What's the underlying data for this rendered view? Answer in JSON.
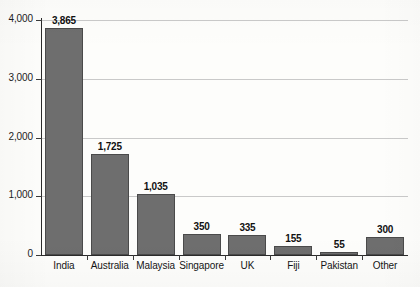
{
  "chart_data": {
    "type": "bar",
    "title": "",
    "xlabel": "",
    "ylabel": "",
    "ylim": [
      0,
      4000
    ],
    "grid": true,
    "legend": "none",
    "categories": [
      "India",
      "Australia",
      "Malaysia",
      "Singapore",
      "UK",
      "Fiji",
      "Pakistan",
      "Other"
    ],
    "values": [
      3865,
      1725,
      1035,
      350,
      335,
      155,
      55,
      300
    ],
    "value_labels": [
      "3,865",
      "1,725",
      "1,035",
      "350",
      "335",
      "155",
      "55",
      "300"
    ],
    "ytick_values": [
      0,
      1000,
      2000,
      3000,
      4000
    ],
    "ytick_labels": [
      "0",
      "1,000",
      "2,000",
      "3,000",
      "4,000"
    ],
    "bar_color": "#6e6e6e",
    "bar_edge_color": "#4a4a4a",
    "gridline_color": "#c9c9c9",
    "axis_color": "#2b2b2b",
    "background_color": "#fdfdfb"
  }
}
